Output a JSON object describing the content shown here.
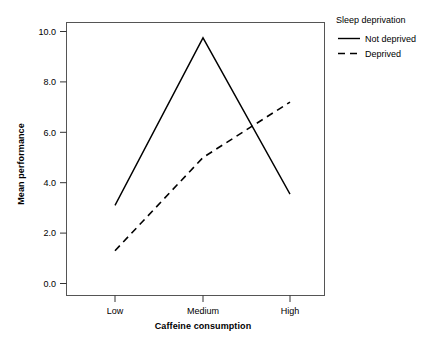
{
  "chart_data": {
    "type": "line",
    "title": "",
    "xlabel": "Caffeine consumption",
    "ylabel": "Mean performance",
    "categories": [
      "Low",
      "Medium",
      "High"
    ],
    "ylim": [
      0.0,
      10.0
    ],
    "yticks": [
      "0.0",
      "2.0",
      "4.0",
      "6.0",
      "8.0",
      "10.0"
    ],
    "ytick_values": [
      0.0,
      2.0,
      4.0,
      6.0,
      8.0,
      10.0
    ],
    "grid": false,
    "legend_position": "right",
    "series": [
      {
        "name": "Not deprived",
        "style": "solid",
        "color": "#000000",
        "values": [
          3.1,
          9.75,
          3.55
        ]
      },
      {
        "name": "Deprived",
        "style": "dashed",
        "color": "#000000",
        "values": [
          1.3,
          5.0,
          7.2
        ]
      }
    ]
  },
  "legend": {
    "title": "Sleep deprivation",
    "items": [
      {
        "label": "Not deprived",
        "style": "solid"
      },
      {
        "label": "Deprived",
        "style": "dashed"
      }
    ]
  },
  "axes": {
    "x_label": "Caffeine consumption",
    "y_label": "Mean performance",
    "x_ticks": [
      "Low",
      "Medium",
      "High"
    ],
    "y_ticks": [
      "10.0",
      "8.0",
      "6.0",
      "4.0",
      "2.0",
      "0.0"
    ]
  }
}
